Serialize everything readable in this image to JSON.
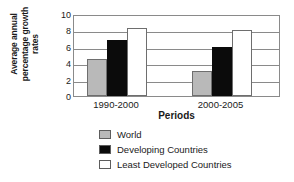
{
  "chart_data": {
    "type": "bar",
    "title": "",
    "xlabel": "Periods",
    "ylabel": "Average annual percentage growth rates",
    "ylabel_lines": [
      "Average annual",
      "percentage growth",
      "rates"
    ],
    "categories": [
      "1990-2000",
      "2000-2005"
    ],
    "series": [
      {
        "name": "World",
        "values": [
          4.5,
          3.1
        ],
        "color": "#b9b9b9"
      },
      {
        "name": "Developing Countries",
        "values": [
          6.8,
          6.0
        ],
        "color": "#0b0b0b"
      },
      {
        "name": "Least Developed Countries",
        "values": [
          8.3,
          8.0
        ],
        "color": "#ffffff"
      }
    ],
    "ylim": [
      0,
      10
    ],
    "yticks": [
      0,
      2,
      4,
      6,
      8,
      10
    ],
    "ytick_labels": [
      "0",
      "2",
      "4",
      "6",
      "8",
      "10"
    ],
    "grid": true,
    "legend_position": "bottom"
  },
  "legend": {
    "items": [
      {
        "label": "World"
      },
      {
        "label": "Developing Countries"
      },
      {
        "label": "Least Developed Countries"
      }
    ]
  }
}
